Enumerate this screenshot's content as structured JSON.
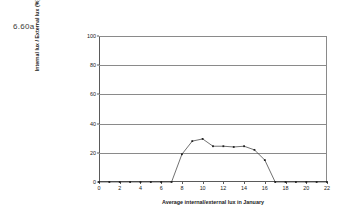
{
  "figure": {
    "label": "6.60a"
  },
  "chart_data": {
    "type": "line",
    "title": "",
    "xlabel": "Average internal/external lux in January",
    "ylabel": "Internal lux / External lux (%)",
    "xlim": [
      0,
      22
    ],
    "ylim": [
      0,
      100
    ],
    "grid": true,
    "legend": "none",
    "xticks": [
      0,
      2,
      4,
      6,
      8,
      10,
      12,
      14,
      16,
      18,
      20,
      22
    ],
    "xtick_labels": [
      "0",
      "2",
      "4",
      "6",
      "8",
      "10",
      "12",
      "14",
      "16",
      "18",
      "20",
      "22"
    ],
    "yticks": [
      0,
      20,
      40,
      60,
      80,
      100
    ],
    "ytick_labels": [
      "0",
      "20",
      "40",
      "60",
      "80",
      "100"
    ],
    "marker": "square",
    "line_color": "#333333",
    "marker_color": "#222222",
    "grid_color": "#8a8a8a",
    "x": [
      0,
      1,
      2,
      3,
      4,
      5,
      6,
      7,
      8,
      9,
      10,
      11,
      12,
      13,
      14,
      15,
      16,
      17,
      18,
      19,
      20,
      21,
      22
    ],
    "values": [
      0,
      0,
      0,
      0,
      0,
      0,
      0,
      0,
      19,
      28,
      29.5,
      24.5,
      24.5,
      24,
      24.5,
      22,
      15,
      0,
      0,
      0,
      0,
      0,
      0
    ]
  }
}
